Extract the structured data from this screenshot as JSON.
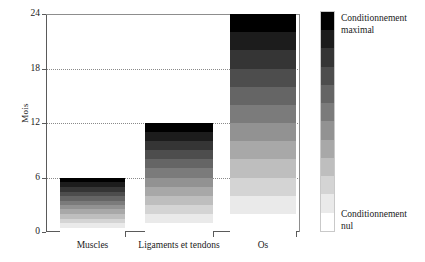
{
  "chart_data": {
    "type": "bar",
    "title": "",
    "subtitle": "",
    "xlabel": "",
    "ylabel": "Mois",
    "categories": [
      "Muscles",
      "Ligaments et tendons",
      "Os"
    ],
    "values": [
      6,
      12,
      24
    ],
    "ylim": [
      0,
      24
    ],
    "yticks": [
      0,
      6,
      12,
      18,
      24
    ],
    "ytick_labels": [
      "0",
      "6",
      "12",
      "18",
      "24"
    ],
    "gridlines": [
      6,
      12,
      18
    ],
    "grid": true,
    "grid_style": "dotted",
    "legend": {
      "position": "right",
      "type": "gradient-colorbar",
      "top_label": "Conditionnement maximal",
      "bottom_label": "Conditionnement nul",
      "top_color": "#0a0a0a",
      "bottom_color": "#ffffff",
      "steps": 12
    },
    "series": [
      {
        "name": "Temps de conditionnement",
        "values": [
          6,
          12,
          24
        ],
        "fill": "vertical-gradient-black-to-white"
      }
    ]
  },
  "axes": {
    "y_label": "Mois",
    "y_ticks": [
      "0",
      "6",
      "12",
      "18",
      "24"
    ],
    "x_ticks": [
      "Muscles",
      "Ligaments et tendons",
      "Os"
    ]
  },
  "legend": {
    "top_label_line1": "Conditionnement",
    "top_label_line2": "maximal",
    "bottom_label_line1": "Conditionnement",
    "bottom_label_line2": "nul"
  },
  "colors": {
    "background": "#ffffff",
    "axis": "#5a5a5a",
    "grid": "#8a8a8a",
    "bar_top": "#0a0a0a",
    "bar_bottom": "#ffffff",
    "text": "#1a1a1a"
  }
}
